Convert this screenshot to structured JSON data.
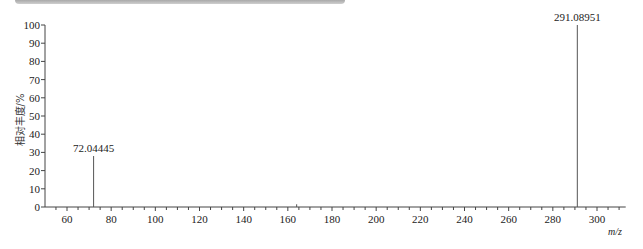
{
  "chart_data": {
    "type": "bar",
    "subtype": "mass-spectrum-stick",
    "title": "",
    "xlabel": "m/z",
    "ylabel": "相对丰度/%",
    "xlim": [
      50,
      313
    ],
    "ylim": [
      0,
      100
    ],
    "x_ticks": [
      60,
      80,
      100,
      120,
      140,
      160,
      180,
      200,
      220,
      240,
      260,
      280,
      300
    ],
    "y_ticks": [
      0,
      10,
      20,
      30,
      40,
      50,
      60,
      70,
      80,
      90,
      100
    ],
    "grid": false,
    "legend": null,
    "peaks": [
      {
        "mz": 72.04445,
        "intensity": 28,
        "label": "72.04445"
      },
      {
        "mz": 164.0,
        "intensity": 1.5,
        "label": ""
      },
      {
        "mz": 291.08951,
        "intensity": 100,
        "label": "291.08951"
      }
    ]
  },
  "labels": {
    "ylabel": "相对丰度/%",
    "xlabel": "m/z",
    "peak1": "72.04445",
    "peak2": "291.08951"
  }
}
